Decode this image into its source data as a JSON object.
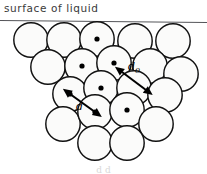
{
  "figure": {
    "title": "surface of liquid",
    "caption_partial": "d   d",
    "colors": {
      "background": "#ffffff",
      "circle_stroke": "#111111",
      "circle_fill": "#fbfbfa",
      "surface_line": "#55565a",
      "label_text": "#3a3a3a",
      "marker_dot": "#000000",
      "arrow": "#000000"
    },
    "surface_line": {
      "label": "surface-of-liquid-line",
      "x1": 0,
      "y1": 20.5,
      "x2": 207,
      "y2": 22.5,
      "stroke_width": 1.2
    },
    "circle_radius": 17.2,
    "circles": [
      {
        "id": "c1",
        "cx": 31,
        "cy": 40,
        "dot": false
      },
      {
        "id": "c2",
        "cx": 64,
        "cy": 40,
        "dot": false
      },
      {
        "id": "c3",
        "cx": 97,
        "cy": 39,
        "dot": true
      },
      {
        "id": "c4",
        "cx": 135,
        "cy": 41,
        "dot": false
      },
      {
        "id": "c5",
        "cx": 173,
        "cy": 41,
        "dot": false
      },
      {
        "id": "c6",
        "cx": 48,
        "cy": 67,
        "dot": false
      },
      {
        "id": "c7",
        "cx": 82,
        "cy": 66,
        "dot": true
      },
      {
        "id": "c8",
        "cx": 114,
        "cy": 63,
        "dot": true
      },
      {
        "id": "c9",
        "cx": 150,
        "cy": 66,
        "dot": false
      },
      {
        "id": "c10",
        "cx": 181,
        "cy": 74,
        "dot": false
      },
      {
        "id": "c11",
        "cx": 70,
        "cy": 94,
        "dot": true
      },
      {
        "id": "c12",
        "cx": 101,
        "cy": 88,
        "dot": true
      },
      {
        "id": "c13",
        "cx": 134,
        "cy": 88,
        "dot": false
      },
      {
        "id": "c14",
        "cx": 165,
        "cy": 95,
        "dot": false
      },
      {
        "id": "c15",
        "cx": 63,
        "cy": 124,
        "dot": false
      },
      {
        "id": "c16",
        "cx": 95,
        "cy": 112,
        "dot": true
      },
      {
        "id": "c17",
        "cx": 127,
        "cy": 110,
        "dot": true
      },
      {
        "id": "c18",
        "cx": 156,
        "cy": 124,
        "dot": false
      },
      {
        "id": "c19",
        "cx": 95,
        "cy": 143,
        "dot": false
      },
      {
        "id": "c20",
        "cx": 127,
        "cy": 143,
        "dot": false
      }
    ],
    "annotations": [
      {
        "id": "d-measure",
        "label": "d",
        "meaning": "centre-to-centre separation of adjacent molecules",
        "x1": 70,
        "y1": 94,
        "x2": 95,
        "y2": 112,
        "label_x": 76,
        "label_y": 110,
        "double_headed": true
      },
      {
        "id": "d0-measure",
        "label": "d",
        "sub": "0",
        "meaning": "molecular diameter",
        "x1": 122,
        "y1": 72,
        "x2": 146,
        "y2": 90,
        "label_x": 128,
        "label_y": 70,
        "double_headed": true
      }
    ]
  }
}
